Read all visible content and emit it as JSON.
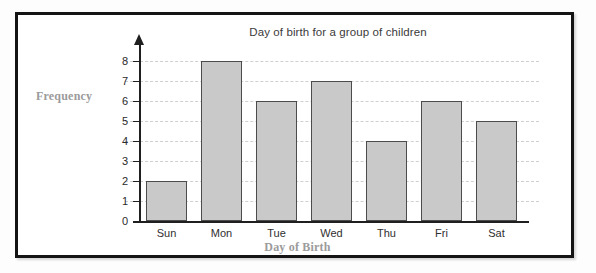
{
  "chart_data": {
    "type": "bar",
    "title": "Day of birth for a group of children",
    "xlabel": "Day of Birth",
    "ylabel": "Frequency",
    "categories": [
      "Sun",
      "Mon",
      "Tue",
      "Wed",
      "Thu",
      "Fri",
      "Sat"
    ],
    "values": [
      2,
      8,
      6,
      7,
      4,
      6,
      5
    ],
    "ylim": [
      0,
      8
    ],
    "ytick_labels": [
      "0",
      "1",
      "2",
      "3",
      "4",
      "5",
      "6",
      "7",
      "8"
    ],
    "ytick_values": [
      0,
      1,
      2,
      3,
      4,
      5,
      6,
      7,
      8
    ],
    "grid": "horizontal-dashed",
    "legend": "none",
    "bar_fill_color": "#c9c9c9",
    "bar_border_color": "#4c4c4c",
    "gridline_color": "#cfcfcf",
    "axis_color": "#1f1f1f",
    "axis_title_color": "#9b9b9b",
    "title_color": "#3b3b3b",
    "frame_color": "#141414",
    "background_color": "#ffffff"
  }
}
